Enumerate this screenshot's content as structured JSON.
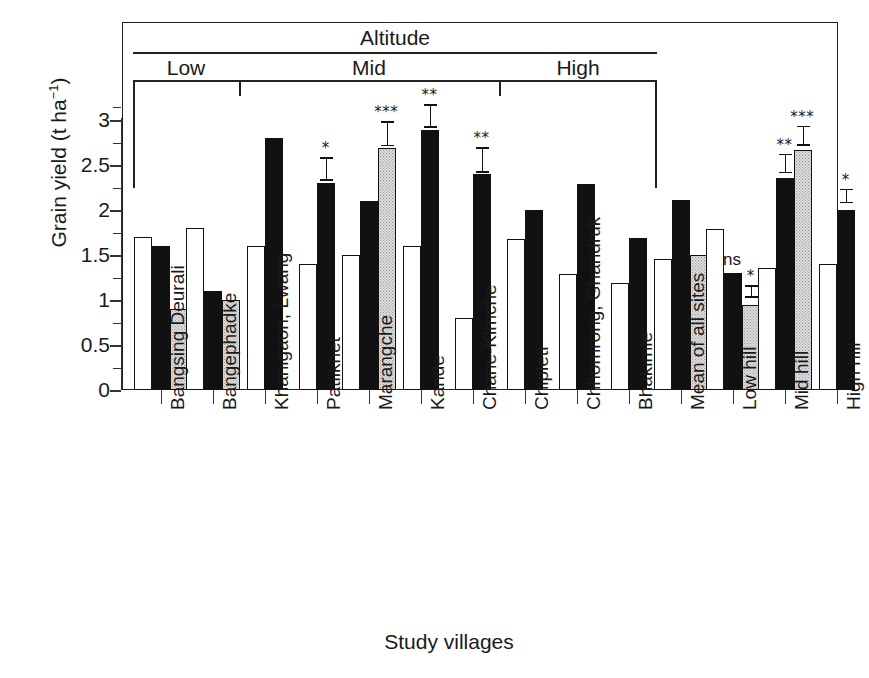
{
  "chart_data": {
    "type": "bar",
    "title": "",
    "xlabel": "Study villages",
    "ylabel": "Grain yield (t ha",
    "ylabel_sup": "−1",
    "ylabel_close": ")",
    "ylim": [
      0,
      3.25
    ],
    "yticks": [
      0,
      0.5,
      1,
      1.5,
      2,
      2.5,
      3
    ],
    "ytick_labels": [
      "0",
      "0.5",
      "1",
      "1.5",
      "2",
      "2.5",
      "3"
    ],
    "minor_yticks": [
      0.25,
      0.75,
      1.25,
      1.75,
      2.25,
      2.75,
      3.15
    ],
    "grid": false,
    "legend": "none",
    "series": [
      {
        "name": "white",
        "fill": "white"
      },
      {
        "name": "black",
        "fill": "black"
      },
      {
        "name": "gray",
        "fill": "gray"
      }
    ],
    "categories": [
      "Bangsing Deurali",
      "Bangephadke",
      "Khanigaon, Lwang",
      "Patlikhet",
      "Marangche",
      "Kande",
      "Chane-Kimche",
      "Chipleti",
      "Chhomrong, Ghandruk",
      "Bhakimle",
      "Mean of all sites",
      "Low hill",
      "Mid hill",
      "High hill"
    ],
    "groups": [
      {
        "category": "Bangsing Deurali",
        "bars": [
          {
            "series": "white",
            "value": 1.7
          },
          {
            "series": "black",
            "value": 1.6
          },
          {
            "series": "gray",
            "value": 0.9
          }
        ]
      },
      {
        "category": "Bangephadke",
        "bars": [
          {
            "series": "white",
            "value": 1.8
          },
          {
            "series": "black",
            "value": 1.1
          },
          {
            "series": "gray",
            "value": 1.0
          }
        ]
      },
      {
        "category": "Khanigaon, Lwang",
        "bars": [
          {
            "series": "white",
            "value": 1.6
          },
          {
            "series": "black",
            "value": 2.8
          }
        ]
      },
      {
        "category": "Patlikhet",
        "bars": [
          {
            "series": "white",
            "value": 1.4
          },
          {
            "series": "black",
            "value": 2.3,
            "error": 0.13,
            "sig": "*"
          }
        ]
      },
      {
        "category": "Marangche",
        "bars": [
          {
            "series": "white",
            "value": 1.5
          },
          {
            "series": "black",
            "value": 2.1
          },
          {
            "series": "gray",
            "value": 2.69,
            "error": 0.14,
            "sig": "***"
          }
        ]
      },
      {
        "category": "Kande",
        "bars": [
          {
            "series": "white",
            "value": 1.6
          },
          {
            "series": "black",
            "value": 2.89,
            "error": 0.13,
            "sig": "**"
          }
        ]
      },
      {
        "category": "Chane-Kimche",
        "bars": [
          {
            "series": "white",
            "value": 0.8
          },
          {
            "series": "black",
            "value": 2.4,
            "error": 0.14,
            "sig": "**"
          }
        ]
      },
      {
        "category": "Chipleti",
        "bars": [
          {
            "series": "white",
            "value": 1.68
          },
          {
            "series": "black",
            "value": 2.0
          }
        ]
      },
      {
        "category": "Chhomrong, Ghandruk",
        "bars": [
          {
            "series": "white",
            "value": 1.29
          },
          {
            "series": "black",
            "value": 2.29
          }
        ]
      },
      {
        "category": "Bhakimle",
        "bars": [
          {
            "series": "white",
            "value": 1.19
          },
          {
            "series": "black",
            "value": 1.69
          }
        ]
      },
      {
        "category": "Mean of all sites",
        "bars": [
          {
            "series": "white",
            "value": 1.46
          },
          {
            "series": "black",
            "value": 2.11
          },
          {
            "series": "gray",
            "value": 1.5
          }
        ]
      },
      {
        "category": "Low hill",
        "bars": [
          {
            "series": "white",
            "value": 1.79
          },
          {
            "series": "black",
            "value": 1.3,
            "sig": "ns"
          },
          {
            "series": "gray",
            "value": 0.94,
            "error": 0.07,
            "sig": "*"
          }
        ]
      },
      {
        "category": "Mid hill",
        "bars": [
          {
            "series": "white",
            "value": 1.36
          },
          {
            "series": "black",
            "value": 2.36,
            "error": 0.11,
            "sig": "**"
          },
          {
            "series": "gray",
            "value": 2.67,
            "error": 0.11,
            "sig": "***"
          }
        ]
      },
      {
        "category": "High hill",
        "bars": [
          {
            "series": "white",
            "value": 1.4
          },
          {
            "series": "black",
            "value": 2.0,
            "error": 0.08,
            "sig": "*"
          }
        ]
      }
    ],
    "annotations": {
      "altitude_title": "Altitude",
      "altitude_classes": [
        {
          "label": "Low",
          "categories": [
            "Bangsing Deurali",
            "Bangephadke"
          ]
        },
        {
          "label": "Mid",
          "categories": [
            "Khanigaon, Lwang",
            "Patlikhet",
            "Marangche",
            "Kande",
            "Chane-Kimche"
          ]
        },
        {
          "label": "High",
          "categories": [
            "Chipleti",
            "Chhomrong, Ghandruk",
            "Bhakimle"
          ]
        }
      ],
      "significance_legend": [
        "*",
        "**",
        "***",
        "ns"
      ]
    },
    "colors": {
      "series_white": "#ffffff",
      "series_black": "#111111",
      "series_gray": "#dcdcdc",
      "axis": "#222222",
      "text": "#1a1a1a"
    }
  }
}
